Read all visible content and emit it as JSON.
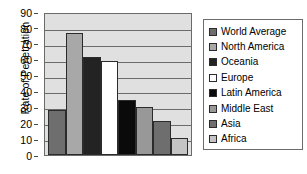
{
  "chart_data": {
    "type": "bar",
    "title": "",
    "subtitle": "",
    "xlabel": "",
    "ylabel": "Rate of Penetration",
    "ylim": [
      0,
      90
    ],
    "ytick_step": 10,
    "yticks": [
      90,
      80,
      70,
      60,
      50,
      40,
      30,
      20,
      10,
      0
    ],
    "grid": true,
    "grid_axis": "y",
    "legend_position": "right",
    "xtick_labels_visible": false,
    "categories": [
      "World Average",
      "North America",
      "Oceania",
      "Europe",
      "Latin America",
      "Middle East",
      "Asia",
      "Africa"
    ],
    "values": [
      28.5,
      77.0,
      61.5,
      59.0,
      34.5,
      30.0,
      21.5,
      11.0
    ],
    "bar_colors": [
      "#6e6e6e",
      "#a8a8a8",
      "#232323",
      "#ffffff",
      "#0a0a0a",
      "#989898",
      "#6e6e6e",
      "#c4c4c4"
    ],
    "bar_edge_color": "#2b2b2b",
    "plot_background": "#e0e0e0",
    "axis_color": "#6b6b6b",
    "legend_entries": [
      {
        "label": "World Average",
        "color": "#6e6e6e"
      },
      {
        "label": "North America",
        "color": "#a8a8a8"
      },
      {
        "label": "Oceania",
        "color": "#232323"
      },
      {
        "label": "Europe",
        "color": "#ffffff"
      },
      {
        "label": "Latin America",
        "color": "#0a0a0a"
      },
      {
        "label": "Middle East",
        "color": "#989898"
      },
      {
        "label": "Asia",
        "color": "#6e6e6e"
      },
      {
        "label": "Africa",
        "color": "#c4c4c4"
      }
    ]
  }
}
